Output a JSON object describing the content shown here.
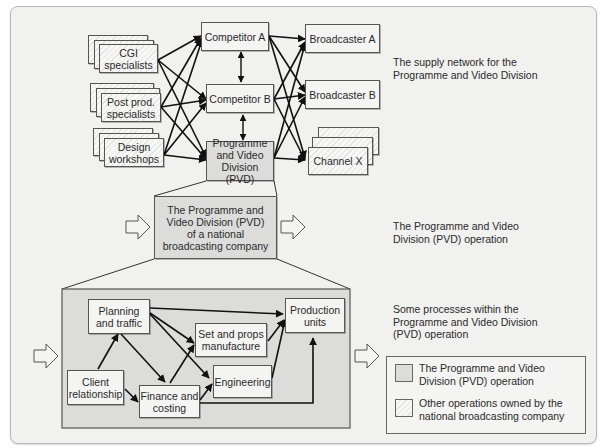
{
  "section_labels": {
    "supply_network": "The supply network for the Programme and Video Division",
    "operation": "The Programme and Video Division (PVD) operation",
    "processes": "Some processes within the Programme and Video Division (PVD) operation"
  },
  "supply_network": {
    "suppliers": [
      "CGI specialists",
      "Post prod. specialists",
      "Design workshops"
    ],
    "competitors": [
      "Competitor A",
      "Competitor B"
    ],
    "pvd": "Programme and Video Division (PVD)",
    "customers": [
      "Broadcaster A",
      "Broadcaster B",
      "Channel X"
    ]
  },
  "operation": {
    "box": "The Programme and Video Division (PVD) of a national broadcasting company"
  },
  "processes": {
    "planning": "Planning and traffic",
    "client": "Client relationship",
    "finance": "Finance and costing",
    "set_props": "Set and props manufacture",
    "engineering": "Engineering",
    "production": "Production units"
  },
  "legend": {
    "items": [
      {
        "label": "The Programme and Video Division (PVD) operation",
        "color": "#dcdcda"
      },
      {
        "label": "Other operations owned by the national broadcasting company",
        "pattern": "hatched"
      }
    ]
  },
  "colors": {
    "background": "#f1f1ef",
    "pvd_fill": "#dcdcda",
    "line": "#1a1a1a"
  }
}
